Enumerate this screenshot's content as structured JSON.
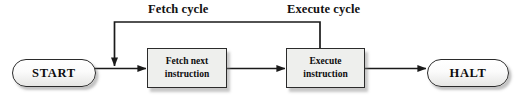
{
  "diagram": {
    "labels": {
      "fetch_cycle": "Fetch cycle",
      "execute_cycle": "Execute cycle"
    },
    "nodes": {
      "start": "START",
      "fetch_line1": "Fetch next",
      "fetch_line2": "instruction",
      "execute_line1": "Execute",
      "execute_line2": "instruction",
      "halt": "HALT"
    },
    "colors": {
      "stroke": "#2b2b2b",
      "box_fill": "#eeefed",
      "terminator_fill": "#f5f5f3",
      "text": "#0d0d0d",
      "shadow": "#9a9a9a",
      "background": "#ffffff"
    }
  }
}
